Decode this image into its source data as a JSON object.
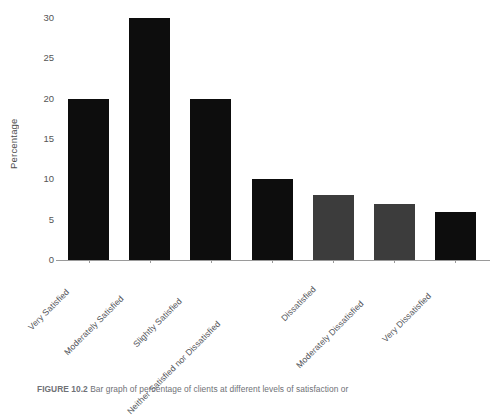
{
  "chart_data": {
    "type": "bar",
    "title": "",
    "subtitle": "",
    "xlabel": "",
    "ylabel": "Percentage",
    "ylim": [
      0,
      30
    ],
    "ytick_values": [
      0,
      5,
      10,
      15,
      20,
      25,
      30
    ],
    "ytick_labels": [
      "0",
      "5",
      "10",
      "15",
      "20",
      "25",
      "30"
    ],
    "grid": false,
    "legend": null,
    "categories": [
      "Very Satisfied",
      "Moderately Satisfied",
      "Slightly Satisfied",
      "Neither Satisfied nor Dissatisfied",
      "Dissatisfied",
      "Moderately Dissatisfied",
      "Very Dissatisfied"
    ],
    "values": [
      20,
      30,
      20,
      10,
      8,
      7,
      6
    ],
    "bar_colors": [
      "#0d0d0d",
      "#0d0d0d",
      "#0d0d0d",
      "#0d0d0d",
      "#3c3c3c",
      "#3c3c3c",
      "#0d0d0d"
    ],
    "xtick_rotation": -45,
    "axis_color": "#9a9a9a"
  },
  "caption": {
    "figure_number": "FIGURE 10.2",
    "text": "Bar graph of percentage of clients at different levels of satisfaction or"
  }
}
